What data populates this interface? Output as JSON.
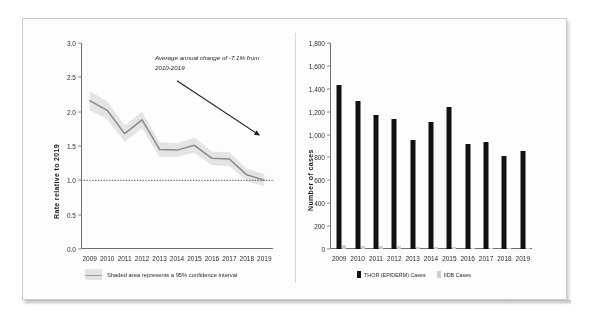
{
  "figure": {
    "background_color": "#fdfdfd",
    "border_color": "#c9c9c9"
  },
  "chart_data": [
    {
      "type": "line",
      "title": "",
      "xlabel": "",
      "ylabel": "Rate relative to 2019",
      "x": [
        2009,
        2010,
        2011,
        2012,
        2013,
        2014,
        2015,
        2016,
        2017,
        2018,
        2019
      ],
      "xtick_labels": [
        "2009",
        "2010",
        "2011",
        "2012",
        "2013",
        "2014",
        "2015",
        "2016",
        "2017",
        "2018",
        "2019"
      ],
      "ytick_labels": [
        "3.0",
        "2.5",
        "2.0",
        "1.5",
        "1.0",
        "0.5",
        "0.0"
      ],
      "ylim": [
        0.0,
        3.0
      ],
      "grid": false,
      "series": [
        {
          "name": "Rate relative to 2019",
          "values": [
            2.16,
            2.02,
            1.68,
            1.88,
            1.45,
            1.44,
            1.51,
            1.32,
            1.31,
            1.08,
            1.0
          ],
          "color": "#8c8c8c"
        },
        {
          "name": "95% confidence interval upper",
          "values": [
            2.3,
            2.15,
            1.8,
            2.0,
            1.56,
            1.54,
            1.62,
            1.42,
            1.41,
            1.17,
            1.09
          ],
          "color": "#e3e3e3"
        },
        {
          "name": "95% confidence interval lower",
          "values": [
            2.02,
            1.89,
            1.56,
            1.76,
            1.34,
            1.34,
            1.4,
            1.22,
            1.21,
            0.99,
            0.91
          ],
          "color": "#e3e3e3"
        }
      ],
      "reference_line": {
        "value": 1.0,
        "style": "dotted",
        "color": "#555555"
      },
      "annotation": "Average annual change of -7.1% from 2010-2019",
      "annotation_arrow": {
        "from": [
          2014.0,
          2.45
        ],
        "to": [
          2018.7,
          1.66
        ]
      },
      "legend_position": "bottom",
      "legend": [
        "Shaded area represents a 95% confidence interval"
      ]
    },
    {
      "type": "bar",
      "title": "",
      "xlabel": "",
      "ylabel": "Number of cases",
      "categories": [
        "2009",
        "2010",
        "2011",
        "2012",
        "2013",
        "2014",
        "2015",
        "2016",
        "2017",
        "2018",
        "2019"
      ],
      "ytick_labels": [
        "1,800",
        "1,600",
        "1,400",
        "1,200",
        "1,000",
        "800",
        "600",
        "400",
        "200",
        "0"
      ],
      "ylim": [
        0,
        1800
      ],
      "grid": false,
      "series": [
        {
          "name": "THOR (EPIDERM) Cases",
          "color": "#111111",
          "values": [
            1430,
            1290,
            1175,
            1140,
            955,
            1110,
            1240,
            920,
            935,
            810,
            860
          ]
        },
        {
          "name": "IIDB Cases",
          "color": "#cfcfcf",
          "values": [
            35,
            30,
            25,
            30,
            20,
            18,
            20,
            12,
            10,
            8,
            6
          ]
        }
      ],
      "legend_position": "bottom",
      "legend": [
        "THOR (EPIDERM) Cases",
        "IIDB Cases"
      ]
    }
  ]
}
